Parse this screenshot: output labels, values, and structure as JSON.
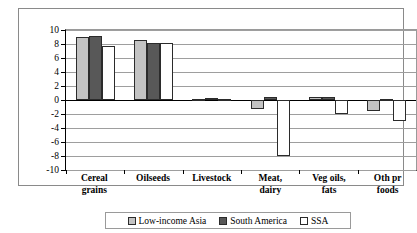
{
  "chart_data": {
    "type": "bar",
    "title": "",
    "xlabel": "",
    "ylabel": "Percentage-point difference",
    "ylim": [
      -10,
      10
    ],
    "ytick_step": 2,
    "yticks": [
      10,
      8,
      6,
      4,
      2,
      0,
      -2,
      -4,
      -6,
      -8,
      -10
    ],
    "ytick_labels": [
      "10",
      "8",
      "6",
      "4",
      "2",
      "0",
      "-2",
      "-4",
      "-6",
      "-8",
      "-10"
    ],
    "grid": true,
    "legend_position": "bottom",
    "categories": [
      {
        "line1": "Cereal",
        "line2": "grains"
      },
      {
        "line1": "Oilseeds",
        "line2": ""
      },
      {
        "line1": "Livestock",
        "line2": ""
      },
      {
        "line1": "Meat,",
        "line2": "dairy"
      },
      {
        "line1": "Veg oils,",
        "line2": "fats"
      },
      {
        "line1": "Oth pr",
        "line2": "foods"
      }
    ],
    "series": [
      {
        "name": "Low-income Asia",
        "color": "#c3c3c3",
        "values": [
          9.0,
          8.6,
          0.1,
          -1.3,
          0.5,
          -1.5
        ]
      },
      {
        "name": "South America",
        "color": "#585858",
        "values": [
          9.1,
          8.2,
          0.3,
          0.4,
          0.5,
          0.2
        ]
      },
      {
        "name": "SSA",
        "color": "#ffffff",
        "values": [
          7.7,
          8.2,
          0.2,
          -8.0,
          -2.0,
          -3.0
        ]
      }
    ]
  }
}
